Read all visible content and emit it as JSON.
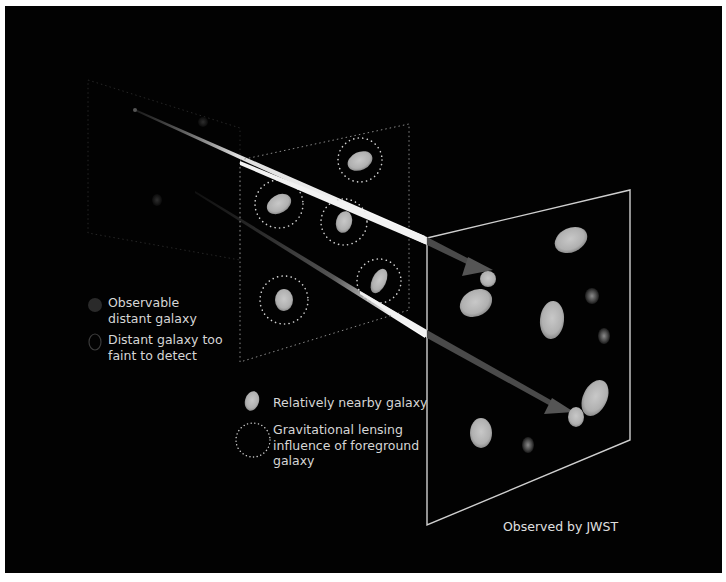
{
  "diagram": {
    "colors": {
      "background": "#020202",
      "galaxy_fill": "#b9b9b9",
      "distant_galaxy_fill": "#3a3a3a",
      "lensing_ring": "#d0d0d0",
      "plane_outline_back": "#2a2a2a",
      "plane_outline_mid": "#9a9a9a",
      "plane_outline_front": "#cfcfcf",
      "light_ray": "#f0f0f0",
      "arrow_head": "#555555",
      "text": "#d9d9d9"
    },
    "planes": [
      {
        "name": "distant-galaxy-plane",
        "style": "dotted-faint"
      },
      {
        "name": "foreground-galaxy-plane",
        "style": "dotted"
      },
      {
        "name": "observed-image-plane",
        "style": "solid"
      }
    ],
    "legend_left": [
      {
        "icon": "observable-distant-galaxy-icon",
        "line1": "Observable",
        "line2": "distant galaxy"
      },
      {
        "icon": "faint-distant-galaxy-icon",
        "line1": "Distant galaxy too",
        "line2": "faint to detect"
      }
    ],
    "legend_center": [
      {
        "icon": "nearby-galaxy-icon",
        "line1": "Relatively nearby galaxy"
      },
      {
        "icon": "lensing-ring-icon",
        "line1": "Gravitational lensing",
        "line2": "influence of foreground",
        "line3": "galaxy"
      }
    ],
    "caption": "Observed by JWST"
  }
}
